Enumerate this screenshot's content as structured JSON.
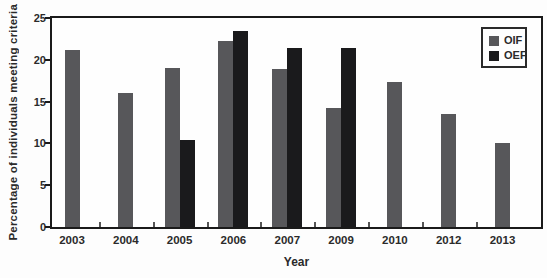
{
  "chart_data": {
    "type": "bar",
    "title": "",
    "xlabel": "Year",
    "ylabel": "Percentage of individuals meeting criteria",
    "categories": [
      "2003",
      "2004",
      "2005",
      "2006",
      "2007",
      "2009",
      "2010",
      "2012",
      "2013"
    ],
    "series": [
      {
        "name": "OIF",
        "color": "#57575a",
        "values": [
          21.2,
          16.0,
          19.0,
          22.2,
          18.9,
          14.2,
          17.3,
          13.5,
          10.0
        ]
      },
      {
        "name": "OEF",
        "color": "#1a1a1c",
        "values": [
          null,
          null,
          10.4,
          23.5,
          21.4,
          21.4,
          null,
          null,
          null
        ]
      }
    ],
    "ylim": [
      0,
      25
    ],
    "yticks": [
      0,
      5,
      10,
      15,
      20,
      25
    ],
    "grid": false,
    "legend_position": "top-right",
    "frame_color": "#1a1a1a",
    "text_color": "#2a2a2a",
    "background_color": "#fdfdfd"
  }
}
